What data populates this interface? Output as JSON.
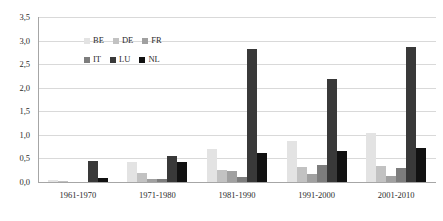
{
  "chart_data": {
    "type": "bar",
    "title": "",
    "subtitle": "",
    "xlabel": "",
    "ylabel": "",
    "ylim": [
      0,
      3.5
    ],
    "ytick_labels": [
      "0,0",
      "0,5",
      "1,0",
      "1,5",
      "2,0",
      "2,5",
      "3,0",
      "3,5"
    ],
    "ytick_values": [
      0,
      0.5,
      1.0,
      1.5,
      2.0,
      2.5,
      3.0,
      3.5
    ],
    "grid": "horizontal",
    "legend_position": "inside-top-left",
    "categories": [
      "1961-1970",
      "1971-1980",
      "1981-1990",
      "1991-2000",
      "2001-2010"
    ],
    "series": [
      {
        "name": "BE",
        "color": "#e3e3e3",
        "values": [
          0.05,
          0.42,
          0.71,
          0.86,
          1.04
        ]
      },
      {
        "name": "DE",
        "color": "#c2c2c2",
        "values": [
          0.03,
          0.2,
          0.26,
          0.31,
          0.33
        ]
      },
      {
        "name": "FR",
        "color": "#a0a0a0",
        "values": [
          0.01,
          0.06,
          0.24,
          0.17,
          0.13
        ]
      },
      {
        "name": "IT",
        "color": "#7d7d7d",
        "values": [
          0.0,
          0.06,
          0.1,
          0.36,
          0.3
        ]
      },
      {
        "name": "LU",
        "color": "#393939",
        "values": [
          0.45,
          0.56,
          2.83,
          2.18,
          2.86
        ]
      },
      {
        "name": "NL",
        "color": "#111111",
        "values": [
          0.09,
          0.43,
          0.62,
          0.65,
          0.72
        ]
      }
    ]
  },
  "legend": {
    "rows": [
      [
        {
          "label": "BE",
          "key": "BE"
        },
        {
          "label": "DE",
          "key": "DE"
        },
        {
          "label": "FR",
          "key": "FR"
        }
      ],
      [
        {
          "label": "IT",
          "key": "IT"
        },
        {
          "label": "LU",
          "key": "LU"
        },
        {
          "label": "NL",
          "key": "NL"
        }
      ]
    ]
  }
}
